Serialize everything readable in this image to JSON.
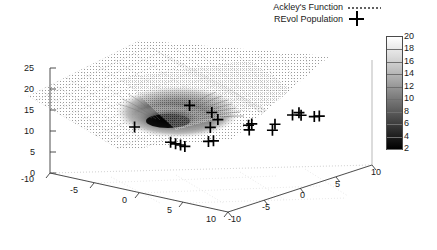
{
  "legend": {
    "items": [
      {
        "label": "Ackley's Function",
        "marker": "dotted-line-icon"
      },
      {
        "label": "REvol Population",
        "marker": "plus-marker-icon"
      }
    ]
  },
  "colorbar": {
    "title": "",
    "ticks": [
      "20",
      "18",
      "16",
      "14",
      "12",
      "10",
      "8",
      "6",
      "4",
      "2"
    ],
    "min": 2,
    "max": 20,
    "top_color": "#ffffff",
    "bottom_color": "#000000"
  },
  "axes": {
    "z_ticks": [
      "25",
      "20",
      "15",
      "10",
      "5",
      "0"
    ],
    "x_ticks": [
      "-10",
      "-5",
      "0",
      "5",
      "10"
    ],
    "y_ticks": [
      "-10",
      "-5",
      "0",
      "5",
      "10"
    ],
    "z_range": [
      0,
      25
    ],
    "x_range": [
      -10,
      10
    ],
    "y_range": [
      -10,
      10
    ]
  },
  "chart_data": {
    "type": "scatter",
    "title": "",
    "xlabel": "",
    "ylabel": "",
    "zlabel": "",
    "xlim": [
      -10,
      10
    ],
    "ylim": [
      -10,
      10
    ],
    "zlim": [
      0,
      25
    ],
    "grid": true,
    "legend_position": "top-right",
    "series": [
      {
        "name": "Ackley's Function",
        "type": "surface",
        "render": "dotted-mesh",
        "colormap": "gray",
        "cmin": 2,
        "cmax": 20,
        "description": "Ackley function surface, global minimum at origin shown as dark funnel"
      },
      {
        "name": "REvol Population",
        "type": "scatter3d",
        "marker": "plus",
        "points": [
          {
            "x": -2.0,
            "y": -0.5,
            "z": 14.5
          },
          {
            "x": -1.2,
            "y": 1.6,
            "z": 12.0
          },
          {
            "x": -6.0,
            "y": -3.2,
            "z": 9.0
          },
          {
            "x": -0.4,
            "y": 0.4,
            "z": 9.5
          },
          {
            "x": -0.2,
            "y": 1.2,
            "z": 11.0
          },
          {
            "x": -2.6,
            "y": -2.4,
            "z": 6.5
          },
          {
            "x": -2.2,
            "y": -2.2,
            "z": 6.2
          },
          {
            "x": -1.8,
            "y": -2.0,
            "z": 6.0
          },
          {
            "x": -1.4,
            "y": -1.9,
            "z": 5.8
          },
          {
            "x": 0.2,
            "y": -0.6,
            "z": 7.0
          },
          {
            "x": 0.6,
            "y": -0.4,
            "z": 7.2
          },
          {
            "x": 2.6,
            "y": 2.0,
            "z": 10.5
          },
          {
            "x": 2.8,
            "y": 2.2,
            "z": 10.8
          },
          {
            "x": 3.0,
            "y": 1.6,
            "z": 9.8
          },
          {
            "x": 4.6,
            "y": 3.2,
            "z": 11.0
          },
          {
            "x": 4.8,
            "y": 2.6,
            "z": 10.0
          },
          {
            "x": 5.6,
            "y": 4.4,
            "z": 13.0
          },
          {
            "x": 6.0,
            "y": 4.8,
            "z": 13.5
          },
          {
            "x": 6.4,
            "y": 4.6,
            "z": 13.2
          },
          {
            "x": 7.4,
            "y": 5.2,
            "z": 13.0
          },
          {
            "x": 7.8,
            "y": 5.4,
            "z": 13.2
          }
        ]
      }
    ]
  }
}
